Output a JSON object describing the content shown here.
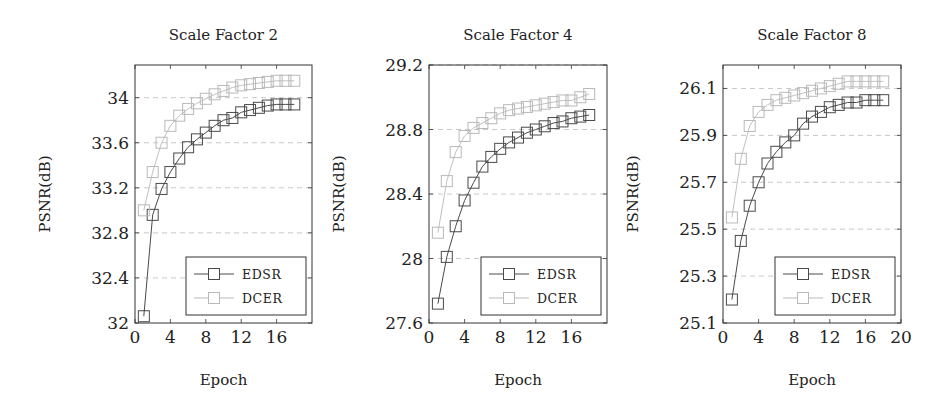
{
  "colors": {
    "EDSR": "#4a4a4a",
    "DCER": "#b9b9b9",
    "axis": "#333333",
    "grid": "#c8c8c8"
  },
  "chart_data": [
    {
      "type": "line",
      "title": "Scale Factor 2",
      "xlabel": "Epoch",
      "ylabel": "PSNR(dB)",
      "xlim": [
        0,
        20
      ],
      "ylim": [
        32,
        34.29
      ],
      "xticks": [
        0,
        4,
        8,
        12,
        16
      ],
      "yticks": [
        32,
        32.4,
        32.8,
        33.2,
        33.6,
        34
      ],
      "ytick_labels": [
        "32",
        "32.4",
        "32.8",
        "33.2",
        "33.6",
        "34"
      ],
      "grid": "horizontal dashed",
      "legend_position": "south east",
      "x": [
        1,
        2,
        3,
        4,
        5,
        6,
        7,
        8,
        9,
        10,
        11,
        12,
        13,
        14,
        15,
        16,
        17,
        18
      ],
      "series": [
        {
          "name": "EDSR",
          "marker": "square",
          "values": [
            32.06,
            32.96,
            33.19,
            33.34,
            33.46,
            33.56,
            33.63,
            33.69,
            33.75,
            33.8,
            33.82,
            33.87,
            33.89,
            33.91,
            33.93,
            33.94,
            33.94,
            33.94
          ]
        },
        {
          "name": "DCER",
          "marker": "square",
          "values": [
            33.0,
            33.34,
            33.6,
            33.75,
            33.84,
            33.9,
            33.95,
            33.99,
            34.03,
            34.06,
            34.09,
            34.11,
            34.12,
            34.13,
            34.14,
            34.15,
            34.15,
            34.15
          ]
        }
      ]
    },
    {
      "type": "line",
      "title": "Scale Factor 4",
      "xlabel": "Epoch",
      "ylabel": "PSNR(dB)",
      "xlim": [
        0,
        20
      ],
      "ylim": [
        27.6,
        29.2
      ],
      "xticks": [
        0,
        4,
        8,
        12,
        16
      ],
      "yticks": [
        27.6,
        28,
        28.4,
        28.8,
        29.2
      ],
      "ytick_labels": [
        "27.6",
        "28",
        "28.4",
        "28.8",
        "29.2"
      ],
      "grid": "horizontal dashed",
      "legend_position": "south east",
      "x": [
        1,
        2,
        3,
        4,
        5,
        6,
        7,
        8,
        9,
        10,
        11,
        12,
        13,
        14,
        15,
        16,
        17,
        18
      ],
      "series": [
        {
          "name": "EDSR",
          "marker": "square",
          "values": [
            27.72,
            28.01,
            28.2,
            28.36,
            28.47,
            28.57,
            28.63,
            28.68,
            28.72,
            28.75,
            28.78,
            28.8,
            28.82,
            28.84,
            28.85,
            28.87,
            28.88,
            28.89
          ]
        },
        {
          "name": "DCER",
          "marker": "square",
          "values": [
            28.16,
            28.48,
            28.66,
            28.76,
            28.81,
            28.84,
            28.87,
            28.9,
            28.92,
            28.93,
            28.94,
            28.95,
            28.96,
            28.97,
            28.98,
            28.98,
            29.0,
            29.02
          ]
        }
      ]
    },
    {
      "type": "line",
      "title": "Scale Factor 8",
      "xlabel": "Epoch",
      "ylabel": "PSNR(dB)",
      "xlim": [
        0,
        20
      ],
      "ylim": [
        25.1,
        26.2
      ],
      "xticks": [
        0,
        4,
        8,
        12,
        16,
        20
      ],
      "yticks": [
        25.1,
        25.3,
        25.5,
        25.7,
        25.9,
        26.1
      ],
      "ytick_labels": [
        "25.1",
        "25.3",
        "25.5",
        "25.7",
        "25.9",
        "26.1"
      ],
      "grid": "horizontal dashed",
      "legend_position": "south east",
      "x": [
        1,
        2,
        3,
        4,
        5,
        6,
        7,
        8,
        9,
        10,
        11,
        12,
        13,
        14,
        15,
        16,
        17,
        18
      ],
      "series": [
        {
          "name": "EDSR",
          "marker": "square",
          "values": [
            25.2,
            25.45,
            25.6,
            25.7,
            25.78,
            25.83,
            25.87,
            25.9,
            25.95,
            25.98,
            26.0,
            26.02,
            26.03,
            26.04,
            26.04,
            26.05,
            26.05,
            26.05
          ]
        },
        {
          "name": "DCER",
          "marker": "square",
          "values": [
            25.55,
            25.8,
            25.94,
            26.0,
            26.03,
            26.05,
            26.06,
            26.07,
            26.08,
            26.09,
            26.1,
            26.11,
            26.12,
            26.13,
            26.13,
            26.13,
            26.13,
            26.13
          ]
        }
      ]
    }
  ],
  "layout": {
    "panels": [
      {
        "left": 135,
        "top": 65,
        "width": 177,
        "height": 258
      },
      {
        "left": 429,
        "top": 65,
        "width": 178,
        "height": 258
      },
      {
        "left": 723,
        "top": 65,
        "width": 178,
        "height": 258
      }
    ]
  }
}
